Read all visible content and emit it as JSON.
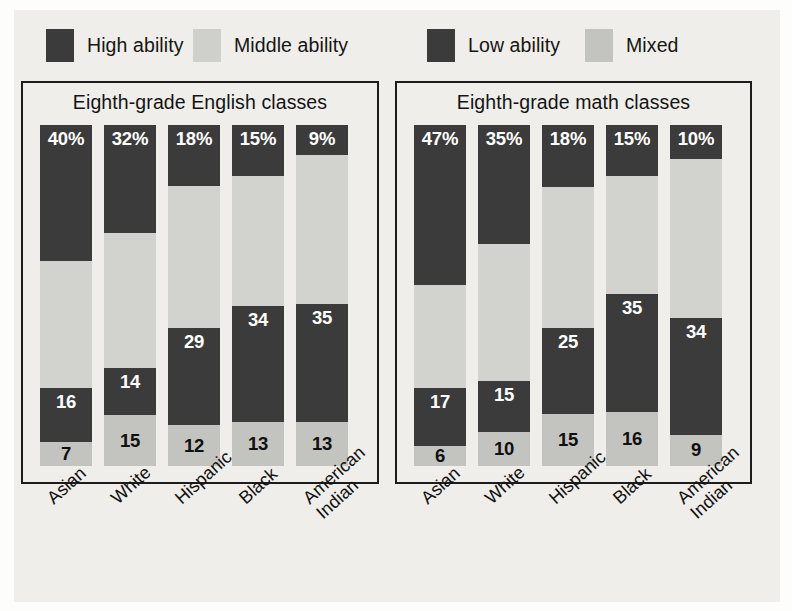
{
  "legend": {
    "items": [
      {
        "label": "High ability",
        "color": "#3b3b3b",
        "icon": "legend-swatch-high"
      },
      {
        "label": "Middle ability",
        "color": "#cfcfcb",
        "icon": "legend-swatch-middle"
      },
      {
        "label": "Low ability",
        "color": "#3b3b3b",
        "icon": "legend-swatch-low"
      },
      {
        "label": "Mixed",
        "color": "#c3c3bf",
        "icon": "legend-swatch-mixed"
      }
    ]
  },
  "panels": [
    {
      "title": "Eighth-grade English classes"
    },
    {
      "title": "Eighth-grade math classes"
    }
  ],
  "colors": {
    "high": "#3b3b3b",
    "middle": "#d2d2ce",
    "low": "#3b3b3b",
    "mixed": "#c3c3bf",
    "paper": "#efeeea",
    "ink": "#1d1d1d"
  },
  "chart_data": [
    {
      "type": "bar",
      "title": "Eighth-grade English classes",
      "stacked": true,
      "normalized": true,
      "xlabel": "",
      "ylabel": "",
      "ylim": [
        0,
        100
      ],
      "grid": false,
      "legend_position": "top",
      "categories": [
        "Asian",
        "White",
        "Hispanic",
        "Black",
        "American Indian"
      ],
      "series": [
        {
          "name": "High ability",
          "values": [
            40,
            32,
            18,
            15,
            9
          ],
          "labels": [
            "40%",
            "32%",
            "18%",
            "15%",
            "9%"
          ]
        },
        {
          "name": "Middle ability",
          "values": [
            37,
            40,
            42,
            38,
            44
          ],
          "labels": [
            "37",
            "40",
            "42",
            "38",
            "44"
          ]
        },
        {
          "name": "Low ability",
          "values": [
            16,
            14,
            29,
            34,
            35
          ],
          "labels": [
            "16",
            "14",
            "29",
            "34",
            "35"
          ]
        },
        {
          "name": "Mixed",
          "values": [
            7,
            15,
            12,
            13,
            13
          ],
          "labels": [
            "7",
            "15",
            "12",
            "13",
            "13"
          ]
        }
      ]
    },
    {
      "type": "bar",
      "title": "Eighth-grade math classes",
      "stacked": true,
      "normalized": true,
      "xlabel": "",
      "ylabel": "",
      "ylim": [
        0,
        100
      ],
      "grid": false,
      "legend_position": "top",
      "categories": [
        "Asian",
        "White",
        "Hispanic",
        "Black",
        "American Indian"
      ],
      "series": [
        {
          "name": "High ability",
          "values": [
            47,
            35,
            18,
            15,
            10
          ],
          "labels": [
            "47%",
            "35%",
            "18%",
            "15%",
            "10%"
          ]
        },
        {
          "name": "Middle ability",
          "values": [
            30,
            40,
            41,
            35,
            46
          ],
          "labels": [
            "30",
            "40",
            "41",
            "35",
            "46"
          ]
        },
        {
          "name": "Low ability",
          "values": [
            17,
            15,
            25,
            35,
            34
          ],
          "labels": [
            "17",
            "15",
            "25",
            "35",
            "34"
          ]
        },
        {
          "name": "Mixed",
          "values": [
            6,
            10,
            15,
            16,
            9
          ],
          "labels": [
            "6",
            "10",
            "15",
            "16",
            "9"
          ]
        }
      ]
    }
  ],
  "xtick_labels": [
    {
      "line1": "Asian",
      "line2": ""
    },
    {
      "line1": "White",
      "line2": ""
    },
    {
      "line1": "Hispanic",
      "line2": ""
    },
    {
      "line1": "Black",
      "line2": ""
    },
    {
      "line1": "American",
      "line2": "Indian"
    }
  ]
}
